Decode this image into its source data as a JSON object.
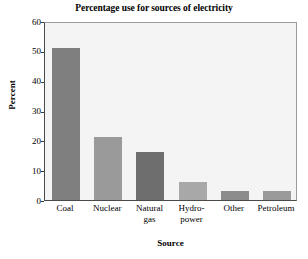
{
  "chart_data": {
    "type": "bar",
    "title": "Percentage use for sources of electricity",
    "xlabel": "Source",
    "ylabel": "Percent",
    "categories": [
      "Coal",
      "Nuclear",
      "Natural gas",
      "Hydro-power",
      "Other",
      "Petroleum"
    ],
    "category_lines": [
      [
        "Coal"
      ],
      [
        "Nuclear"
      ],
      [
        "Natural",
        "gas"
      ],
      [
        "Hydro-",
        "power"
      ],
      [
        "Other"
      ],
      [
        "Petroleum"
      ]
    ],
    "values": [
      51,
      21,
      16,
      6,
      3,
      3
    ],
    "bar_colors": [
      "#7f7f7f",
      "#9a9a9a",
      "#6e6e6e",
      "#a8a8a8",
      "#8c8c8c",
      "#9a9a9a"
    ],
    "ylim": [
      0,
      60
    ],
    "yticks": [
      0,
      10,
      20,
      30,
      40,
      50,
      60
    ],
    "ytick_labels": [
      "0",
      "10",
      "20",
      "30",
      "40",
      "50",
      "60"
    ],
    "grid": false,
    "legend": "none",
    "plot_background": "#f4f4f4",
    "figure_background": "#ffffff",
    "axis_color": "#3a3a3a"
  }
}
